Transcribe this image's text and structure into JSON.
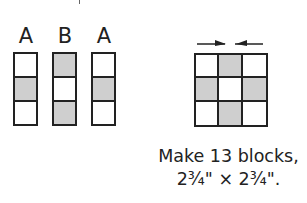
{
  "strips": [
    {
      "label": "A",
      "cells": [
        "white",
        "shaded",
        "white"
      ]
    },
    {
      "label": "B",
      "cells": [
        "shaded",
        "white",
        "shaded"
      ]
    },
    {
      "label": "A",
      "cells": [
        "white",
        "shaded",
        "white"
      ]
    }
  ],
  "block": {
    "cells": [
      "white",
      "shaded",
      "white",
      "shaded",
      "white",
      "shaded",
      "white",
      "shaded",
      "white"
    ],
    "pressing_arrows": "toward-center"
  },
  "caption": {
    "line1": "Make 13 blocks,",
    "line2": "2¾\" × 2¾\"."
  },
  "colors": {
    "shaded": "#cfcfcf",
    "outline": "#222222"
  }
}
